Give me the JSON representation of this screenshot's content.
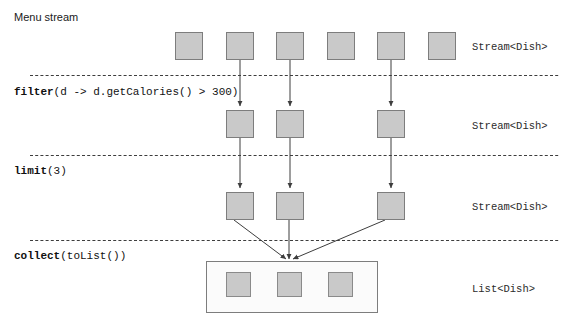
{
  "diagram": {
    "title": "Menu stream",
    "width": 573,
    "height": 323,
    "colors": {
      "box_fill": "#c9c9c9",
      "box_stroke": "#7d7d7d",
      "line": "#3d3d3d",
      "dashed_line": "#3d3d3d",
      "container_fill": "#fbfbfb",
      "text": "#111111",
      "background": "#ffffff"
    },
    "stages": [
      {
        "id": "source",
        "operation_name": "",
        "operation_arg": "",
        "type_label": "Stream<Dish>",
        "element_count": 6,
        "row_y": 32
      },
      {
        "id": "filter",
        "operation_name": "filter",
        "operation_arg": "(d -> d.getCalories() > 300)",
        "type_label": "Stream<Dish>",
        "element_count": 3,
        "row_y": 110
      },
      {
        "id": "limit",
        "operation_name": "limit",
        "operation_arg": "(3)",
        "type_label": "Stream<Dish>",
        "element_count": 3,
        "row_y": 192
      },
      {
        "id": "collect",
        "operation_name": "collect",
        "operation_arg": "(toList())",
        "type_label": "List<Dish>",
        "element_count": 3,
        "row_y": 272
      }
    ],
    "separator_lines_y": [
      75,
      155,
      240
    ],
    "type_label_x": 472,
    "type_label_ys": [
      41,
      120,
      201,
      283
    ],
    "row1_box_xs": [
      175,
      226,
      276,
      327,
      377,
      428
    ],
    "row2_box_xs": [
      226,
      276,
      377
    ],
    "row3_box_xs": [
      226,
      276,
      377
    ],
    "list_box_xs": [
      226,
      276,
      327
    ],
    "box_size": 28,
    "list_inner_size": 25,
    "list_container": {
      "x": 206,
      "y": 261,
      "width": 172,
      "height": 52
    },
    "collect_converge_point": {
      "x": 289,
      "y": 262
    }
  }
}
